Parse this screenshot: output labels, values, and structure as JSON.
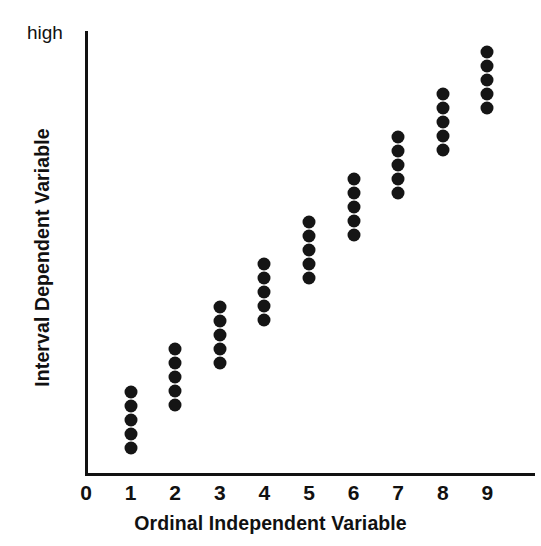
{
  "chart_data": {
    "type": "scatter",
    "title": "",
    "xlabel": "Ordinal Independent Variable",
    "ylabel": "Interval Dependent Variable",
    "y_top_label": "high",
    "grid": false,
    "legend": "none",
    "xlim": [
      0,
      9.6
    ],
    "ylim": [
      0,
      10
    ],
    "x_ticks": [
      "0",
      "1",
      "2",
      "3",
      "4",
      "5",
      "6",
      "7",
      "8",
      "9"
    ],
    "y_ticks": [],
    "point_color": "#151515",
    "axis_color": "#111111",
    "background_color": "#ffffff",
    "points_per_category": 5,
    "categories": [
      1,
      2,
      3,
      4,
      5,
      6,
      7,
      8,
      9
    ],
    "series": [
      {
        "name": "observations",
        "points": [
          {
            "x": 1,
            "y": 1.63
          },
          {
            "x": 1,
            "y": 1.35
          },
          {
            "x": 1,
            "y": 1.07
          },
          {
            "x": 1,
            "y": 0.79
          },
          {
            "x": 1,
            "y": 0.5
          },
          {
            "x": 2,
            "y": 2.48
          },
          {
            "x": 2,
            "y": 2.2
          },
          {
            "x": 2,
            "y": 1.92
          },
          {
            "x": 2,
            "y": 1.64
          },
          {
            "x": 2,
            "y": 1.36
          },
          {
            "x": 3,
            "y": 3.33
          },
          {
            "x": 3,
            "y": 3.05
          },
          {
            "x": 3,
            "y": 2.77
          },
          {
            "x": 3,
            "y": 2.49
          },
          {
            "x": 3,
            "y": 2.21
          },
          {
            "x": 4,
            "y": 4.18
          },
          {
            "x": 4,
            "y": 3.9
          },
          {
            "x": 4,
            "y": 3.62
          },
          {
            "x": 4,
            "y": 3.34
          },
          {
            "x": 4,
            "y": 3.06
          },
          {
            "x": 5,
            "y": 5.03
          },
          {
            "x": 5,
            "y": 4.75
          },
          {
            "x": 5,
            "y": 4.47
          },
          {
            "x": 5,
            "y": 4.19
          },
          {
            "x": 5,
            "y": 3.91
          },
          {
            "x": 6,
            "y": 5.88
          },
          {
            "x": 6,
            "y": 5.6
          },
          {
            "x": 6,
            "y": 5.32
          },
          {
            "x": 6,
            "y": 5.04
          },
          {
            "x": 6,
            "y": 4.76
          },
          {
            "x": 7,
            "y": 6.73
          },
          {
            "x": 7,
            "y": 6.45
          },
          {
            "x": 7,
            "y": 6.17
          },
          {
            "x": 7,
            "y": 5.89
          },
          {
            "x": 7,
            "y": 5.61
          },
          {
            "x": 8,
            "y": 7.58
          },
          {
            "x": 8,
            "y": 7.3
          },
          {
            "x": 8,
            "y": 7.02
          },
          {
            "x": 8,
            "y": 6.74
          },
          {
            "x": 8,
            "y": 6.46
          },
          {
            "x": 9,
            "y": 8.43
          },
          {
            "x": 9,
            "y": 8.15
          },
          {
            "x": 9,
            "y": 7.87
          },
          {
            "x": 9,
            "y": 7.59
          },
          {
            "x": 9,
            "y": 7.31
          }
        ]
      }
    ]
  }
}
